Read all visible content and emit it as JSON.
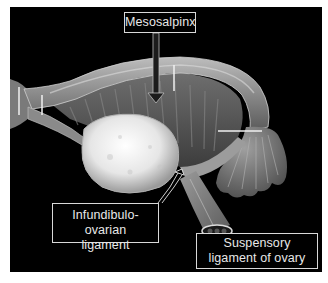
{
  "figure": {
    "background_color": "#000000",
    "label_border_color": "#d8d8d8",
    "label_text_color": "#e8e8e8"
  },
  "labels": {
    "mesosalpinx": "Mesosalpinx",
    "infundibulo_ovarian_line1": "Infundibulo-ovarian",
    "infundibulo_ovarian_line2": "ligament",
    "suspensory_line1": "Suspensory",
    "suspensory_line2": "ligament of ovary"
  },
  "structures": [
    {
      "name": "uterine-tube"
    },
    {
      "name": "ovary"
    },
    {
      "name": "fimbriae"
    },
    {
      "name": "mesosalpinx"
    },
    {
      "name": "suspensory-ligament-cross-section"
    }
  ]
}
